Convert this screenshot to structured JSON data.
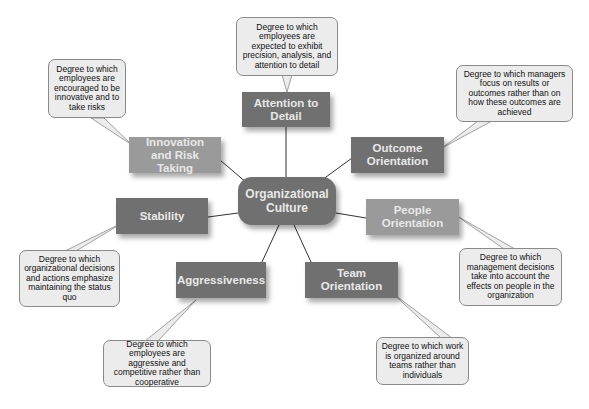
{
  "diagram": {
    "center": {
      "label": "Organizational Culture",
      "color": "#707070"
    },
    "dimensions": [
      {
        "id": "attention",
        "label": "Attention to Detail",
        "description": "Degree to which employees are expected to exhibit precision, analysis, and attention to detail"
      },
      {
        "id": "outcome",
        "label": "Outcome Orientation",
        "description": "Degree to which managers focus on results or outcomes rather than on how these outcomes are achieved"
      },
      {
        "id": "people",
        "label": "People Orientation",
        "description": "Degree to which management decisions take into account the effects on people in the organization"
      },
      {
        "id": "team",
        "label": "Team Orientation",
        "description": "Degree to which work is organized around teams rather than individuals"
      },
      {
        "id": "aggressiveness",
        "label": "Aggressiveness",
        "description": "Degree to which employees are aggressive and competitive rather than cooperative"
      },
      {
        "id": "stability",
        "label": "Stability",
        "description": "Degree to which organizational decisions and actions emphasize maintaining the status quo"
      },
      {
        "id": "innovation",
        "label": "Innovation and Risk Taking",
        "description": "Degree to which employees are encouraged to be innovative and to take risks"
      }
    ],
    "colors": {
      "dark_node": "#707070",
      "light_node": "#9a9a9a",
      "callout_bg": "#ececec",
      "callout_border": "#8a8a8a"
    }
  }
}
